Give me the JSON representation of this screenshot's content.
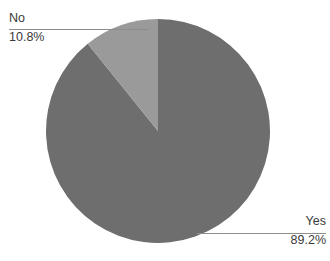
{
  "chart_data": {
    "type": "pie",
    "title": "",
    "categories": [
      "Yes",
      "No"
    ],
    "values": [
      89.2,
      10.8
    ],
    "labels": [
      "89.2%",
      "10.8%"
    ],
    "legend_position": "none",
    "grid": false,
    "series": [
      {
        "name": "Response",
        "values": [
          89.2,
          10.8
        ]
      }
    ],
    "slices": [
      {
        "name": "Yes",
        "label": "Yes",
        "value": 89.2,
        "value_label": "89.2%",
        "color": "#6e6e6e",
        "start_angle": 0,
        "end_angle": 321.12
      },
      {
        "name": "No",
        "label": "No",
        "value": 10.8,
        "value_label": "10.8%",
        "color": "#9a9a9a",
        "start_angle": 321.12,
        "end_angle": 360
      }
    ]
  },
  "geometry": {
    "center_x": 158,
    "center_y": 131,
    "radius": 112
  },
  "colors": {
    "background": "#ffffff",
    "text": "#3a3a3a",
    "leader_line": "#8d8d8d",
    "slice_yes": "#6e6e6e",
    "slice_no": "#9a9a9a"
  },
  "callouts": {
    "no": {
      "label": "No",
      "value": "10.8%"
    },
    "yes": {
      "label": "Yes",
      "value": "89.2%"
    }
  }
}
